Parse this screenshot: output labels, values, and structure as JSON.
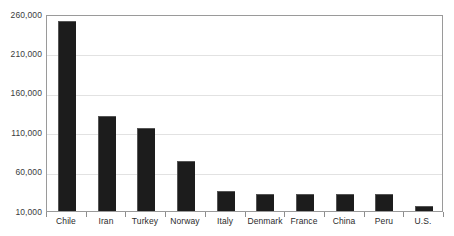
{
  "chart_data": {
    "type": "bar",
    "title": "",
    "subtitle": "",
    "xlabel": "",
    "ylabel": "",
    "categories": [
      "Chile",
      "Iran",
      "Turkey",
      "Norway",
      "Italy",
      "Denmark",
      "France",
      "China",
      "Peru",
      "U.S."
    ],
    "values": [
      251000,
      130000,
      115000,
      74000,
      36000,
      31000,
      31000,
      31000,
      31000,
      16000
    ],
    "ylim": [
      10000,
      260000
    ],
    "yticks": [
      10000,
      60000,
      110000,
      160000,
      210000,
      260000
    ],
    "ytick_labels": [
      "10,000",
      "60,000",
      "110,000",
      "160,000",
      "210,000",
      "260,000"
    ],
    "grid": true,
    "legend": false,
    "bar_color": "#1c1c1c",
    "grid_color": "#e2e2e2",
    "frame_color": "#9a9a9a",
    "background_color": "#ffffff"
  }
}
